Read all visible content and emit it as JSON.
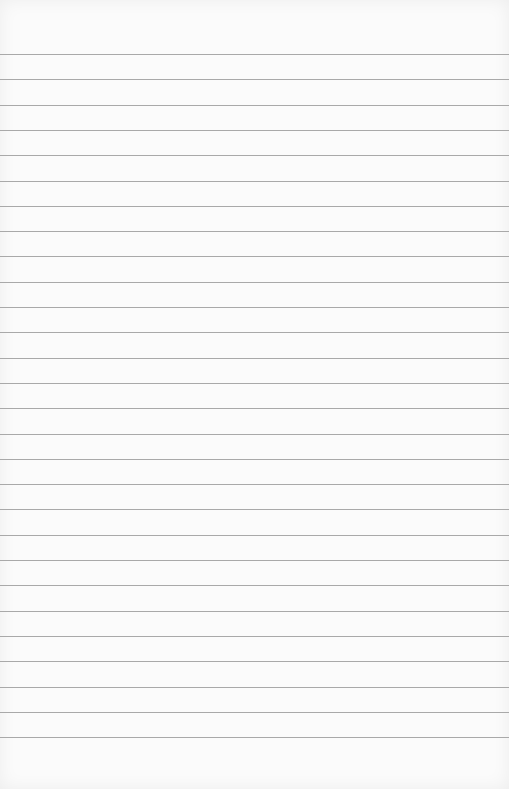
{
  "paper": {
    "type": "ruled-notebook-page",
    "background_color": "#fbfbfb",
    "line_color": "#a9a9a9",
    "first_line_y": 54,
    "line_spacing": 25.3,
    "line_count": 28
  }
}
